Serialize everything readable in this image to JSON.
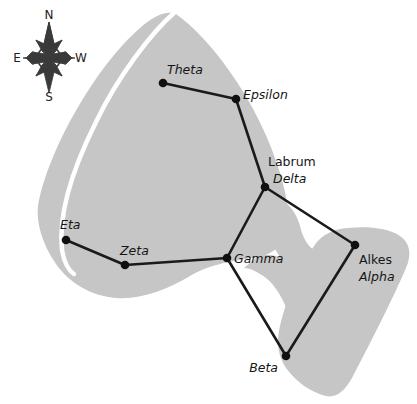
{
  "figure": {
    "background_color": "#ffffff",
    "silhouette_color": "#c6c6c6",
    "line_color": "#1a1a1a",
    "star_color": "#101010"
  },
  "compass": {
    "north_label": "N",
    "south_label": "S",
    "east_label": "E",
    "west_label": "W",
    "east_position": "left",
    "west_position": "right"
  },
  "stars": [
    {
      "greek": "Theta",
      "proper": "",
      "x": 163,
      "y": 83,
      "label_x": 167,
      "label_y": 74,
      "label_anchor": "start",
      "proper_x": 0,
      "proper_y": 0
    },
    {
      "greek": "Epsilon",
      "proper": "",
      "x": 236,
      "y": 99,
      "label_x": 243,
      "label_y": 99,
      "label_anchor": "start",
      "proper_x": 0,
      "proper_y": 0
    },
    {
      "greek": "Delta",
      "proper": "Labrum",
      "x": 265,
      "y": 187,
      "label_x": 273,
      "label_y": 183,
      "label_anchor": "start",
      "proper_x": 268,
      "proper_y": 166
    },
    {
      "greek": "Alpha",
      "proper": "Alkes",
      "x": 355,
      "y": 245,
      "label_x": 359,
      "label_y": 281,
      "label_anchor": "start",
      "proper_x": 359,
      "proper_y": 264
    },
    {
      "greek": "Beta",
      "proper": "",
      "x": 286,
      "y": 356,
      "label_x": 278,
      "label_y": 372,
      "label_anchor": "end",
      "proper_x": 0,
      "proper_y": 0
    },
    {
      "greek": "Gamma",
      "proper": "",
      "x": 227,
      "y": 258,
      "label_x": 234,
      "label_y": 263,
      "label_anchor": "start",
      "proper_x": 0,
      "proper_y": 0
    },
    {
      "greek": "Zeta",
      "proper": "",
      "x": 125,
      "y": 265,
      "label_x": 120,
      "label_y": 255,
      "label_anchor": "start",
      "proper_x": 0,
      "proper_y": 0
    },
    {
      "greek": "Eta",
      "proper": "",
      "x": 66,
      "y": 240,
      "label_x": 60,
      "label_y": 229,
      "label_anchor": "start",
      "proper_x": 0,
      "proper_y": 0
    }
  ],
  "connections": [
    {
      "from": "Theta",
      "to": "Epsilon"
    },
    {
      "from": "Epsilon",
      "to": "Delta"
    },
    {
      "from": "Delta",
      "to": "Alpha"
    },
    {
      "from": "Delta",
      "to": "Gamma"
    },
    {
      "from": "Alpha",
      "to": "Beta"
    },
    {
      "from": "Gamma",
      "to": "Beta"
    },
    {
      "from": "Gamma",
      "to": "Zeta"
    },
    {
      "from": "Zeta",
      "to": "Eta"
    }
  ]
}
